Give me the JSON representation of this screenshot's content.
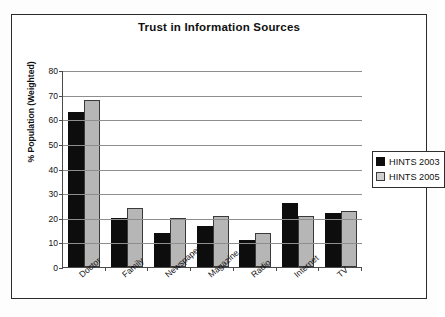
{
  "chart_data": {
    "type": "bar",
    "title": "Trust in Information Sources",
    "xlabel": "",
    "ylabel": "% Population (Weighted)",
    "ylim": [
      0,
      80
    ],
    "ytick_step": 10,
    "yticks": [
      80,
      70,
      60,
      50,
      40,
      30,
      20,
      10,
      0
    ],
    "grid": true,
    "legend_position": "right",
    "categories": [
      "Doctor",
      "Family",
      "Newspaper",
      "Magazine",
      "Radio",
      "Internet",
      "TV"
    ],
    "series": [
      {
        "name": "HINTS 2003",
        "color": "#0d0d0d",
        "values": [
          62,
          19,
          13,
          16,
          10,
          25,
          21
        ]
      },
      {
        "name": "HINTS 2005",
        "color": "#b6b6b6",
        "values": [
          67,
          23,
          19,
          20,
          13,
          20,
          22
        ]
      }
    ]
  },
  "legend": {
    "items": [
      {
        "label": "HINTS 2003"
      },
      {
        "label": "HINTS 2005"
      }
    ]
  }
}
